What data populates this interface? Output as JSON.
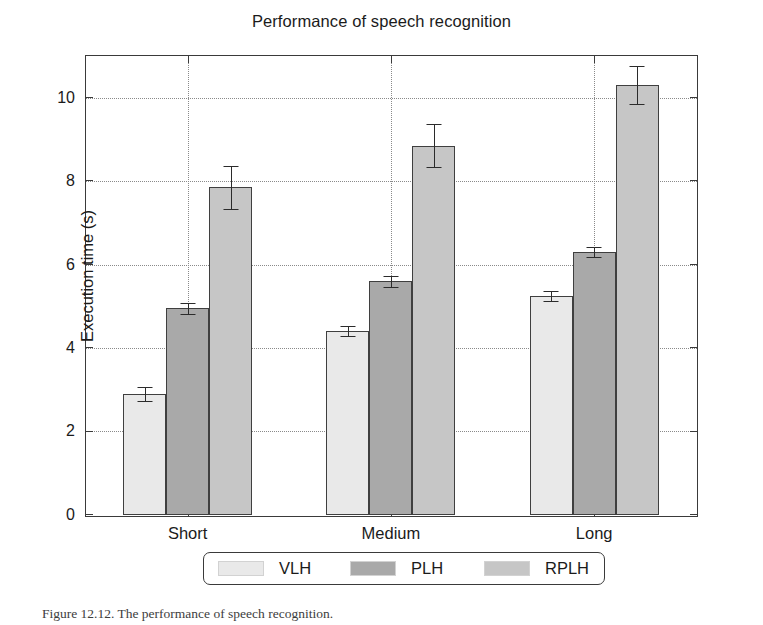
{
  "figure": {
    "caption": "Figure 12.12. The performance of speech recognition."
  },
  "chart_data": {
    "type": "bar",
    "title": "Performance of speech recognition",
    "xlabel": "",
    "ylabel": "Execution time (s)",
    "categories": [
      "Short",
      "Medium",
      "Long"
    ],
    "ylim": [
      0,
      11
    ],
    "yticks": [
      0,
      2,
      4,
      6,
      8,
      10
    ],
    "ytick_labels": [
      "0",
      "2",
      "4",
      "6",
      "8",
      "10"
    ],
    "grid": true,
    "legend_position": "below-axes",
    "series": [
      {
        "name": "VLH",
        "color": "#e9e9e9",
        "values": [
          2.9,
          4.4,
          5.25
        ],
        "errors": [
          0.16,
          0.12,
          0.12
        ]
      },
      {
        "name": "PLH",
        "color": "#a9a9a9",
        "values": [
          4.95,
          5.6,
          6.3
        ],
        "errors": [
          0.14,
          0.13,
          0.13
        ]
      },
      {
        "name": "RPLH",
        "color": "#c6c6c6",
        "values": [
          7.85,
          8.85,
          10.3
        ],
        "errors": [
          0.52,
          0.52,
          0.45
        ]
      }
    ]
  },
  "colors": {
    "axis": "#3a3a3a",
    "grid": "#8a8a8a",
    "bar_edge": "#3f3f3f",
    "error": "#2b2b2b",
    "text": "#1b1b1b",
    "background": "#ffffff"
  }
}
